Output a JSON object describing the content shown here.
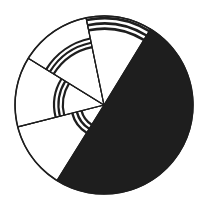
{
  "chart_data": {
    "type": "pie",
    "title": "",
    "center": [
      104,
      105
    ],
    "radius": 89,
    "colors": {
      "fill_dark": "#1e1e1e",
      "stroke": "#1e1e1e",
      "background": "#ffffff"
    },
    "slices": [
      {
        "name": "solid-black-segment",
        "start_deg": 301.5,
        "end_deg": 481.9,
        "percent": 50,
        "fill": "solid",
        "band": null
      },
      {
        "name": "lower-left-segment",
        "start_deg": 121.9,
        "end_deg": 165.8,
        "percent": 12,
        "fill": "white",
        "band": {
          "r_inner": 22,
          "r_outer": 34,
          "stripes": 3
        }
      },
      {
        "name": "left-segment",
        "start_deg": 165.8,
        "end_deg": 211.7,
        "percent": 13,
        "fill": "white",
        "band": {
          "r_inner": 40,
          "r_outer": 51,
          "stripes": 3
        }
      },
      {
        "name": "upper-left-segment",
        "start_deg": 211.7,
        "end_deg": 258.4,
        "percent": 13,
        "fill": "white",
        "band": {
          "r_inner": 58,
          "r_outer": 69,
          "stripes": 3
        }
      },
      {
        "name": "top-segment",
        "start_deg": 258.4,
        "end_deg": 301.5,
        "percent": 12,
        "fill": "white",
        "band": {
          "r_inner": 75,
          "r_outer": 88,
          "stripes": 3
        }
      }
    ],
    "labels": [],
    "legend": null
  }
}
